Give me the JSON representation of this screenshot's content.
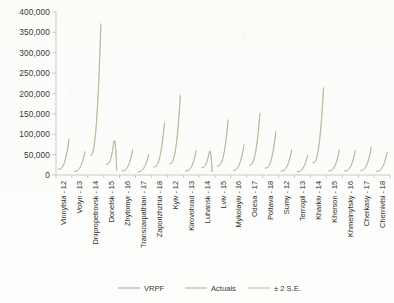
{
  "chart_data": {
    "type": "line",
    "title": "",
    "subtitle": "",
    "xlabel": "",
    "ylabel": "",
    "ylim": [
      0,
      400000
    ],
    "grid": false,
    "legend_position": "bottom",
    "y_ticks": [
      "0",
      "50,000",
      "100,000",
      "150,000",
      "200,000",
      "250,000",
      "300,000",
      "350,000",
      "400,000"
    ],
    "y_tick_values": [
      0,
      50000,
      100000,
      150000,
      200000,
      250000,
      300000,
      350000,
      400000
    ],
    "categories": [
      "Vinnytsia - 12",
      "Volyn - 13",
      "Dnipropetrovsk - 14",
      "Donetsk - 15",
      "Zhytomyr - 16",
      "Transcarpathian - 17",
      "Zaporizhzhia - 18",
      "Kyiv - 12",
      "Kirovohrad - 13",
      "Luhansk - 14",
      "Lviv - 15",
      "Mykolayiv - 16",
      "Odesa - 17",
      "Poltava - 18",
      "Sumy - 12",
      "Ternopil - 13",
      "Kharkiv - 14",
      "Kherson - 15",
      "Khmelnytsky - 16",
      "Cherkasy - 17",
      "Chernivtsi - 18"
    ],
    "series": [
      {
        "name": "VRPF",
        "color": "#8d8fae",
        "panel_peaks": [
          88000,
          57000,
          370000,
          152000,
          62000,
          50000,
          128000,
          196000,
          60000,
          106000,
          135000,
          74000,
          150000,
          106000,
          62000,
          48000,
          214000,
          62000,
          60000,
          68000,
          56000
        ]
      },
      {
        "name": "Actuals",
        "color": "#93a87e",
        "panel_peaks": [
          86000,
          56000,
          366000,
          150000,
          61000,
          49000,
          126000,
          194000,
          59000,
          104000,
          133000,
          73000,
          148000,
          104000,
          61000,
          47000,
          212000,
          61000,
          59000,
          67000,
          55000
        ]
      },
      {
        "name": "± 2 S.E.",
        "color": "#d9a96a",
        "panel_peaks": [
          90000,
          58000,
          374000,
          154000,
          63000,
          51000,
          130000,
          198000,
          61000,
          108000,
          137000,
          75000,
          152000,
          108000,
          63000,
          49000,
          216000,
          63000,
          61000,
          69000,
          57000
        ]
      }
    ],
    "panels": [
      {
        "region": "Vinnytsia - 12",
        "start": 14000,
        "peak": 88000,
        "dip": false
      },
      {
        "region": "Volyn - 13",
        "start": 9000,
        "peak": 57000,
        "dip": false
      },
      {
        "region": "Dnipropetrovsk - 14",
        "start": 48000,
        "peak": 370000,
        "dip": false
      },
      {
        "region": "Donetsk - 15",
        "start": 26000,
        "peak": 152000,
        "dip": true
      },
      {
        "region": "Zhytomyr - 16",
        "start": 10000,
        "peak": 62000,
        "dip": false
      },
      {
        "region": "Transcarpathian - 17",
        "start": 8000,
        "peak": 50000,
        "dip": false
      },
      {
        "region": "Zaporizhzhia - 18",
        "start": 20000,
        "peak": 128000,
        "dip": false
      },
      {
        "region": "Kyiv - 12",
        "start": 28000,
        "peak": 196000,
        "dip": false
      },
      {
        "region": "Kirovohrad - 13",
        "start": 10000,
        "peak": 60000,
        "dip": false
      },
      {
        "region": "Luhansk - 14",
        "start": 18000,
        "peak": 106000,
        "dip": true
      },
      {
        "region": "Lviv - 15",
        "start": 22000,
        "peak": 135000,
        "dip": false
      },
      {
        "region": "Mykolayiv - 16",
        "start": 12000,
        "peak": 74000,
        "dip": false
      },
      {
        "region": "Odesa - 17",
        "start": 24000,
        "peak": 150000,
        "dip": false
      },
      {
        "region": "Poltava - 18",
        "start": 17000,
        "peak": 106000,
        "dip": false
      },
      {
        "region": "Sumy - 12",
        "start": 10000,
        "peak": 62000,
        "dip": false
      },
      {
        "region": "Ternopil - 13",
        "start": 8000,
        "peak": 48000,
        "dip": false
      },
      {
        "region": "Kharkiv - 14",
        "start": 30000,
        "peak": 214000,
        "dip": false
      },
      {
        "region": "Kherson - 15",
        "start": 10000,
        "peak": 62000,
        "dip": false
      },
      {
        "region": "Khmelnytsky - 16",
        "start": 10000,
        "peak": 60000,
        "dip": false
      },
      {
        "region": "Cherkasy - 17",
        "start": 11000,
        "peak": 68000,
        "dip": false
      },
      {
        "region": "Chernivtsi - 18",
        "start": 9000,
        "peak": 56000,
        "dip": false
      }
    ]
  },
  "legend": {
    "items": [
      {
        "label": "VRPF",
        "color": "#8d8fae"
      },
      {
        "label": "Actuals",
        "color": "#93a87e"
      },
      {
        "label": "± 2 S.E.",
        "color": "#d9a96a"
      }
    ]
  }
}
